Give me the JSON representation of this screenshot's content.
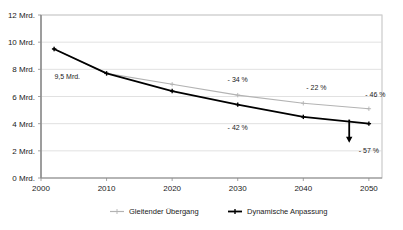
{
  "chart_data": {
    "type": "line",
    "title": "",
    "xlabel": "",
    "ylabel": "",
    "xlim": [
      2000,
      2052
    ],
    "ylim": [
      0,
      12
    ],
    "grid": true,
    "legend_position": "bottom",
    "x_ticks": [
      "2000",
      "2010",
      "2020",
      "2030",
      "2040",
      "2050"
    ],
    "x_tick_values": [
      2000,
      2010,
      2020,
      2030,
      2040,
      2050
    ],
    "y_ticks": [
      "0 Mrd.",
      "2 Mrd.",
      "4 Mrd.",
      "6 Mrd.",
      "8 Mrd.",
      "10 Mrd.",
      "12 Mrd."
    ],
    "y_tick_values": [
      0,
      2,
      4,
      6,
      8,
      10,
      12
    ],
    "x": [
      2002,
      2010,
      2020,
      2030,
      2040,
      2050
    ],
    "series": [
      {
        "name": "Gleitender Übergang",
        "color": "#b3b3b3",
        "values": [
          9.5,
          7.7,
          6.9,
          6.1,
          5.5,
          5.1
        ]
      },
      {
        "name": "Dynamische Anpassung",
        "color": "#000000",
        "values": [
          9.5,
          7.7,
          6.4,
          5.4,
          4.5,
          4.0
        ]
      }
    ],
    "annotations": [
      {
        "name": "start-value-label",
        "text": "9,5 Mrd.",
        "x": 2004,
        "y": 7.3
      },
      {
        "name": "gray-2030-pct",
        "text": "- 34 %",
        "x": 2030,
        "y": 7.1
      },
      {
        "name": "gray-2042-pct",
        "text": "- 22 %",
        "x": 2042,
        "y": 6.5
      },
      {
        "name": "gray-2050-pct",
        "text": "- 46 %",
        "x": 2051,
        "y": 6.0
      },
      {
        "name": "black-2030-pct",
        "text": "- 42 %",
        "x": 2030,
        "y": 3.5
      },
      {
        "name": "black-2050-pct",
        "text": "- 57 %",
        "x": 2050,
        "y": 1.85
      }
    ],
    "arrow": {
      "name": "decline-arrow",
      "x": 2047,
      "y_from": 4.3,
      "y_to": 2.6,
      "color": "#000000"
    }
  },
  "legend": {
    "items": [
      {
        "label": "Gleitender Übergang",
        "color": "#b3b3b3",
        "marker": "cross-marker"
      },
      {
        "label": "Dynamische Anpassung",
        "color": "#000000",
        "marker": "cross-marker"
      }
    ]
  }
}
